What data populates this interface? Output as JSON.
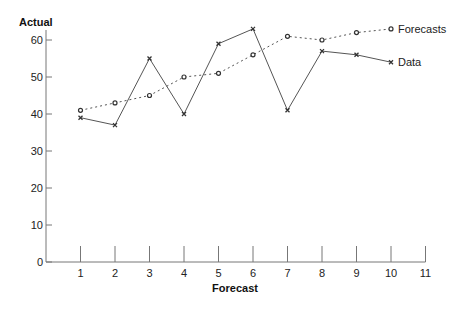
{
  "chart_data": {
    "type": "line",
    "title": "",
    "xlabel": "Forecast",
    "ylabel": "Actual",
    "x": [
      1,
      2,
      3,
      4,
      5,
      6,
      7,
      8,
      9,
      10
    ],
    "x_ticks": [
      "1",
      "2",
      "3",
      "4",
      "5",
      "6",
      "7",
      "8",
      "9",
      "10",
      "11"
    ],
    "y_ticks": [
      "0",
      "10",
      "20",
      "30",
      "40",
      "50",
      "60"
    ],
    "xlim": [
      0,
      11
    ],
    "ylim": [
      0,
      63
    ],
    "grid": false,
    "legend_position": "inline-right",
    "series": [
      {
        "name": "Forecasts",
        "style": "dotted",
        "marker": "circle",
        "color": "#555555",
        "values": [
          41,
          43,
          45,
          50,
          51,
          56,
          61,
          60,
          62,
          63
        ]
      },
      {
        "name": "Data",
        "style": "solid",
        "marker": "x",
        "color": "#555555",
        "values": [
          39,
          37,
          55,
          40,
          59,
          63,
          41,
          57,
          56,
          54
        ]
      }
    ]
  }
}
